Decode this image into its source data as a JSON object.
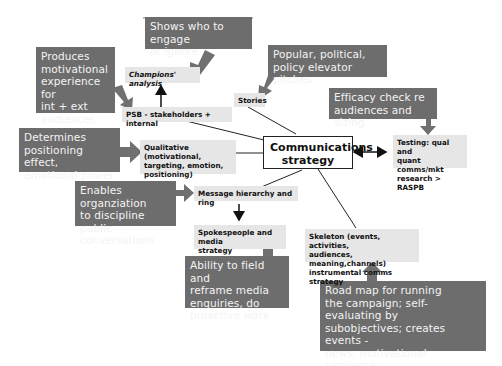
{
  "diagram": {
    "center": {
      "label": "Communications\nstrategy"
    },
    "nodes": [
      {
        "id": "champions",
        "label": "Champions' analysis"
      },
      {
        "id": "psb",
        "label": "PSB - stakeholders + internal"
      },
      {
        "id": "stories",
        "label": "Stories"
      },
      {
        "id": "qualitative",
        "label": "Qualitative (motivational,\ntargeting, emotion,\npositioning)"
      },
      {
        "id": "testing",
        "label": "Testing: qual and\nquant comms/mkt\nresearch > RASPB"
      },
      {
        "id": "message",
        "label": "Message hierarchy and ring"
      },
      {
        "id": "spokespeople",
        "label": "Spokespeople and media\nstrategy"
      },
      {
        "id": "skeleton",
        "label": "Skeleton (events, activities,\naudiences, meaning,channels)\ninstrumental comms strategy"
      }
    ],
    "notes": [
      {
        "id": "note-champions",
        "label": "Shows who to engage\nor ignore"
      },
      {
        "id": "note-psb",
        "label": "Produces\nmotivational\nexperience for\nint + ext\naudiences"
      },
      {
        "id": "note-stories",
        "label": "Popular, political,\npolicy elevator pitches"
      },
      {
        "id": "note-testing",
        "label": "Efficacy check re\naudiences and sizing"
      },
      {
        "id": "note-qualitative",
        "label": "Determines\npositioning effect,\nemotional power"
      },
      {
        "id": "note-message",
        "label": "Enables organziation\nto discipline public\nconversations"
      },
      {
        "id": "note-spokespeople",
        "label": "Ability to field and\nreframe media\nenquiries, do\nproactive work"
      },
      {
        "id": "note-skeleton",
        "label": "Road map for running\nthe campaign; self-evaluating by\nsubobjectives; creates events -\nnews; motivational sequence;\nand visual communications"
      }
    ],
    "colors": {
      "note_bg": "#6d6d6d",
      "note_text": "#f4f4f4",
      "node_bg": "#e6e6e6",
      "line": "#222222",
      "callout_arrow": "#707070"
    }
  }
}
